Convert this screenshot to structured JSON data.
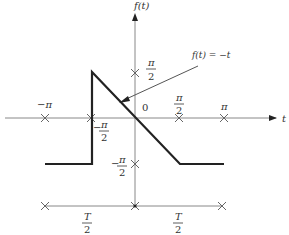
{
  "diagram": {
    "axes": {
      "x_label": "t",
      "y_label": "f(t)"
    },
    "x_ticks": [
      {
        "label_num": "−π",
        "label_den": "",
        "x": 45
      },
      {
        "label_num": "−π",
        "label_den": "2",
        "x": 91
      },
      {
        "label_num": "0",
        "label_den": "",
        "x": 135
      },
      {
        "label_num": "π",
        "label_den": "2",
        "x": 179
      },
      {
        "label_num": "π",
        "label_den": "",
        "x": 224
      }
    ],
    "y_ticks": [
      {
        "label_num": "π",
        "label_den": "2",
        "y": 73
      },
      {
        "label_num": "−π",
        "label_den": "2",
        "y": 164
      }
    ],
    "annotation": {
      "label": "f(t) = −t"
    },
    "period_bracket": {
      "left_label_num": "T",
      "left_label_den": "2",
      "right_label_num": "T",
      "right_label_den": "2"
    },
    "labels": {
      "x_neg_pi": "−π",
      "x_neg_half_pi_num": "π",
      "x_neg_half_pi_sign": "−",
      "x_neg_half_pi_den": "2",
      "origin": "0",
      "x_half_pi_num": "π",
      "x_half_pi_den": "2",
      "x_pi": "π",
      "y_half_pi_num": "π",
      "y_half_pi_den": "2",
      "y_neg_half_pi_sign": "−",
      "y_neg_half_pi_num": "π",
      "y_neg_half_pi_den": "2",
      "t_axis": "t",
      "f_axis": "f(t)",
      "annotation": "f(t) = −t",
      "T_left_num": "T",
      "T_left_den": "2",
      "T_right_num": "T",
      "T_right_den": "2"
    },
    "colors": {
      "axis": "#888888",
      "curve": "#222222",
      "text": "#333333"
    }
  }
}
